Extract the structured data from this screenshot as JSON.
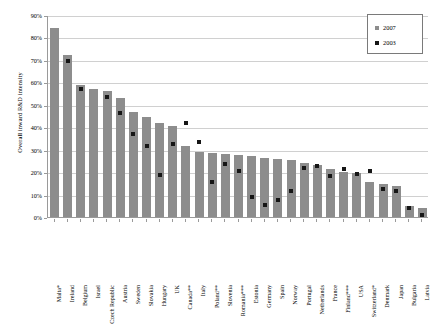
{
  "chart_data": {
    "type": "bar",
    "title": "",
    "xlabel": "",
    "ylabel": "Overall inward R&D intensity",
    "ylim": [
      0,
      90
    ],
    "y_unit": "%",
    "grid": true,
    "legend_position": "top-right",
    "ytick_labels": [
      "90%",
      "80%",
      "70%",
      "60%",
      "50%",
      "40%",
      "30%",
      "20%",
      "10%",
      "0%"
    ],
    "ytick_values": [
      90,
      80,
      70,
      60,
      50,
      40,
      30,
      20,
      10,
      0
    ],
    "categories": [
      "Malta*",
      "Ireland",
      "Belgium",
      "Israel",
      "Czech Republic",
      "Austria",
      "Sweden",
      "Slovakia",
      "Hungary",
      "UK",
      "Canada**",
      "Italy",
      "Poland**",
      "Slovenia",
      "Romania***",
      "Estonia",
      "Germany",
      "Spain",
      "Norway",
      "Portugal",
      "Netherlands",
      "France",
      "Finland***",
      "USA",
      "Switzerland*",
      "Denmark",
      "Japan",
      "Bulgaria",
      "Latvia"
    ],
    "series": [
      {
        "name": "2007",
        "color": "#8d8d8d",
        "marker": "bar",
        "values": [
          84,
          72,
          59,
          57,
          56,
          53,
          47,
          44.5,
          42,
          40.5,
          31.5,
          29,
          28.5,
          28,
          27.5,
          27,
          26.5,
          26,
          25.5,
          24,
          23,
          21.5,
          20,
          19.5,
          15.5,
          14.5,
          14,
          5,
          4
        ]
      },
      {
        "name": "2003",
        "color": "#161616",
        "marker": "square",
        "values": [
          null,
          70,
          57.5,
          null,
          54,
          47,
          37.5,
          32,
          19,
          33,
          42.5,
          34,
          16,
          24,
          21,
          9.5,
          6,
          8,
          12,
          22.5,
          23,
          18.5,
          22,
          19.5,
          21,
          13,
          12,
          4.5,
          1.5
        ]
      }
    ]
  },
  "legend": {
    "items": [
      {
        "label": "2007"
      },
      {
        "label": "2003"
      }
    ]
  }
}
